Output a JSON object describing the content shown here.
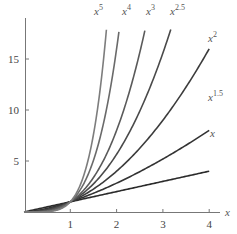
{
  "chart_data": {
    "type": "line",
    "title": "",
    "xlabel": "x",
    "ylabel": "",
    "xlim": [
      0,
      4.4
    ],
    "ylim": [
      0,
      18
    ],
    "grid": false,
    "legend": "inline labels at curve ends",
    "x_ticks": [
      1,
      2,
      3,
      4
    ],
    "y_ticks": [
      5,
      10,
      15
    ],
    "series": [
      {
        "name": "x",
        "base": "x",
        "exponent": "",
        "power": 1,
        "x_end": 4,
        "color": "#2a2a2a",
        "label_pos": [
          210,
          137
        ]
      },
      {
        "name": "x^1.5",
        "base": "x",
        "exponent": "1.5",
        "power": 1.5,
        "x_end": 4,
        "color": "#333333",
        "label_pos": [
          208,
          101
        ]
      },
      {
        "name": "x^2",
        "base": "x",
        "exponent": "2",
        "power": 2,
        "x_end": 4,
        "color": "#3c3c3c",
        "label_pos": [
          208,
          42
        ]
      },
      {
        "name": "x^2.5",
        "base": "x",
        "exponent": "2.5",
        "power": 2.5,
        "x_end": 3.17,
        "color": "#4a4a4a",
        "label_pos": [
          170,
          15
        ]
      },
      {
        "name": "x^3",
        "base": "x",
        "exponent": "3",
        "power": 3,
        "x_end": 2.61,
        "color": "#5a5a5a",
        "label_pos": [
          146,
          15
        ]
      },
      {
        "name": "x^4",
        "base": "x",
        "exponent": "4",
        "power": 4,
        "x_end": 2.05,
        "color": "#6a6a6a",
        "label_pos": [
          122,
          15
        ]
      },
      {
        "name": "x^5",
        "base": "x",
        "exponent": "5",
        "power": 5,
        "x_end": 1.78,
        "color": "#7d7d7d",
        "label_pos": [
          94,
          15
        ]
      }
    ]
  },
  "axes": {
    "x_axis_label": "x",
    "x_tick_labels": [
      "1",
      "2",
      "3",
      "4"
    ],
    "y_tick_labels": [
      "5",
      "10",
      "15"
    ]
  }
}
